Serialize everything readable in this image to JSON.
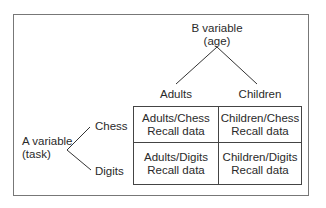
{
  "b_variable": {
    "title": "B variable",
    "subtitle": "(age)",
    "levels": [
      "Adults",
      "Children"
    ]
  },
  "a_variable": {
    "title": "A variable",
    "subtitle": "(task)",
    "levels": [
      "Chess",
      "Digits"
    ]
  },
  "cells": [
    [
      "Adults/Chess",
      "Recall data"
    ],
    [
      "Children/Chess",
      "Recall data"
    ],
    [
      "Adults/Digits",
      "Recall data"
    ],
    [
      "Children/Digits",
      "Recall data"
    ]
  ]
}
